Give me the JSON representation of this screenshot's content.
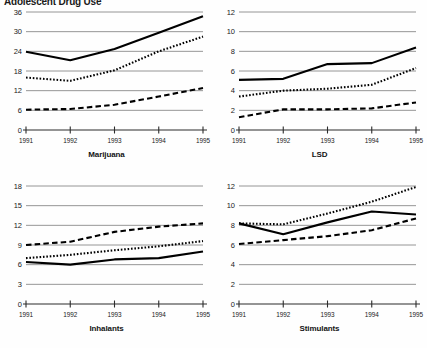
{
  "figure": {
    "title": "Adolescent Drug Use"
  },
  "chart_data": [
    {
      "type": "line",
      "title": "Marijuana",
      "xlabel": "",
      "ylabel": "",
      "x": [
        "1991",
        "1992",
        "1993",
        "1994",
        "1995"
      ],
      "yticks": [
        0,
        6,
        12,
        18,
        24,
        30,
        36
      ],
      "ylim": [
        0,
        36
      ],
      "grid": true,
      "legend": "none",
      "series": [
        {
          "name": "solid",
          "style": "solid",
          "values": [
            23.9,
            21.3,
            24.7,
            29.7,
            34.7
          ]
        },
        {
          "name": "dotted",
          "style": "dotted",
          "values": [
            16.0,
            15.0,
            18.2,
            24.0,
            28.5
          ]
        },
        {
          "name": "dashed",
          "style": "dashed",
          "values": [
            6.2,
            6.4,
            7.7,
            10.2,
            12.8
          ]
        }
      ]
    },
    {
      "type": "line",
      "title": "LSD",
      "xlabel": "",
      "ylabel": "",
      "x": [
        "1991",
        "1992",
        "1993",
        "1994",
        "1995"
      ],
      "yticks": [
        0,
        2,
        4,
        6,
        8,
        10,
        12
      ],
      "ylim": [
        0,
        12
      ],
      "grid": true,
      "legend": "none",
      "series": [
        {
          "name": "solid",
          "style": "solid",
          "values": [
            5.1,
            5.2,
            6.7,
            6.8,
            8.4
          ]
        },
        {
          "name": "dotted",
          "style": "dotted",
          "values": [
            3.4,
            4.0,
            4.2,
            4.6,
            6.3
          ]
        },
        {
          "name": "dashed",
          "style": "dashed",
          "values": [
            1.3,
            2.1,
            2.1,
            2.2,
            2.8
          ]
        }
      ]
    },
    {
      "type": "line",
      "title": "Inhalants",
      "xlabel": "",
      "ylabel": "",
      "x": [
        "1991",
        "1992",
        "1993",
        "1994",
        "1995"
      ],
      "yticks": [
        0,
        3,
        6,
        9,
        12,
        15,
        18
      ],
      "ylim": [
        0,
        18
      ],
      "grid": true,
      "legend": "none",
      "series": [
        {
          "name": "dashed",
          "style": "dashed",
          "values": [
            9.0,
            9.5,
            11.0,
            11.8,
            12.3
          ]
        },
        {
          "name": "dotted",
          "style": "dotted",
          "values": [
            7.0,
            7.5,
            8.2,
            8.8,
            9.6
          ]
        },
        {
          "name": "solid",
          "style": "solid",
          "values": [
            6.4,
            6.0,
            6.8,
            7.0,
            8.0
          ]
        }
      ]
    },
    {
      "type": "line",
      "title": "Stimulants",
      "xlabel": "",
      "ylabel": "",
      "x": [
        "1991",
        "1992",
        "1993",
        "1994",
        "1995"
      ],
      "yticks": [
        0,
        2,
        4,
        6,
        8,
        10,
        12
      ],
      "ylim": [
        0,
        12
      ],
      "grid": true,
      "legend": "none",
      "series": [
        {
          "name": "dotted",
          "style": "dotted",
          "values": [
            8.2,
            8.1,
            9.2,
            10.4,
            11.9
          ]
        },
        {
          "name": "solid",
          "style": "solid",
          "values": [
            8.2,
            7.1,
            8.3,
            9.4,
            9.1
          ]
        },
        {
          "name": "dashed",
          "style": "dashed",
          "values": [
            6.1,
            6.5,
            6.9,
            7.5,
            8.7
          ]
        }
      ]
    }
  ]
}
